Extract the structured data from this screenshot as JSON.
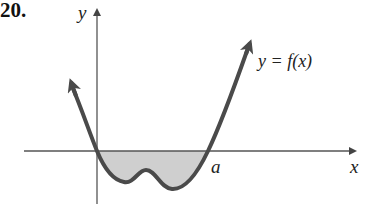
{
  "problem_number": "20.",
  "labels": {
    "y_axis": "y",
    "x_axis": "x",
    "curve": "y = f(x)",
    "point_a": "a"
  },
  "colors": {
    "curve": "#4a4a4a",
    "shade": "#cfcfcf",
    "axis": "#555555"
  }
}
